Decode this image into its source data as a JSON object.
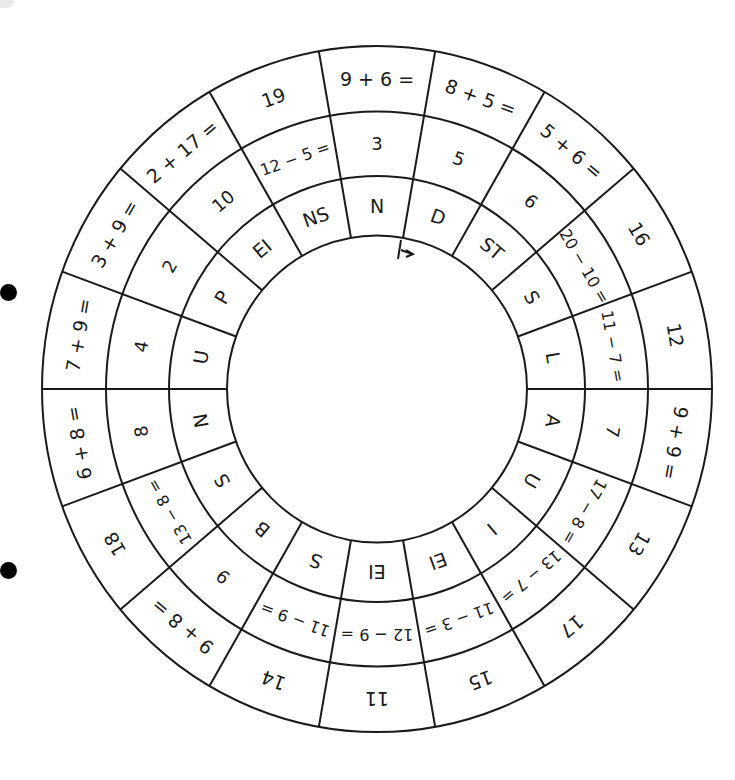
{
  "worksheet": {
    "title": "Rechenrad",
    "start_marker": "arrow-start-marker",
    "segments": [
      {
        "angle": 0,
        "outer": "9 + 6 =",
        "middle": "3",
        "inner": "N"
      },
      {
        "angle": 20,
        "outer": "8 + 5 =",
        "middle": "5",
        "inner": "D"
      },
      {
        "angle": 40,
        "outer": "5 + 6 =",
        "middle": "6",
        "inner": "ST"
      },
      {
        "angle": 60,
        "outer": "16",
        "middle": "20 − 10 =",
        "inner": "S"
      },
      {
        "angle": 80,
        "outer": "12",
        "middle": "11 − 7 =",
        "inner": "L"
      },
      {
        "angle": 100,
        "outer": "9 + 9 =",
        "middle": "7",
        "inner": "A"
      },
      {
        "angle": 120,
        "outer": "13",
        "middle": "17 − 8 =",
        "inner": "U"
      },
      {
        "angle": 140,
        "outer": "17",
        "middle": "13 − 7 =",
        "inner": "I"
      },
      {
        "angle": 160,
        "outer": "15",
        "middle": "11 − 3 =",
        "inner": "EI"
      },
      {
        "angle": 180,
        "outer": "11",
        "middle": "12 − 9 =",
        "inner": "EI"
      },
      {
        "angle": 200,
        "outer": "14",
        "middle": "11 − 9 =",
        "inner": "S"
      },
      {
        "angle": 220,
        "outer": "9 + 8 =",
        "middle": "9",
        "inner": "B"
      },
      {
        "angle": 240,
        "outer": "18",
        "middle": "13 − 8 =",
        "inner": "S"
      },
      {
        "angle": 260,
        "outer": "6 + 8 =",
        "middle": "8",
        "inner": "N"
      },
      {
        "angle": 280,
        "outer": "7 + 9 =",
        "middle": "4",
        "inner": "U"
      },
      {
        "angle": 300,
        "outer": "3 + 9 =",
        "middle": "2",
        "inner": "P"
      },
      {
        "angle": 320,
        "outer": "2 + 17 =",
        "middle": "10",
        "inner": "EI"
      },
      {
        "angle": 340,
        "outer": "19",
        "middle": "12 − 5 =",
        "inner": "NS"
      }
    ]
  },
  "colors": {
    "ink": "#1a1a1a",
    "paper": "#ffffff",
    "hole": "#000000"
  }
}
